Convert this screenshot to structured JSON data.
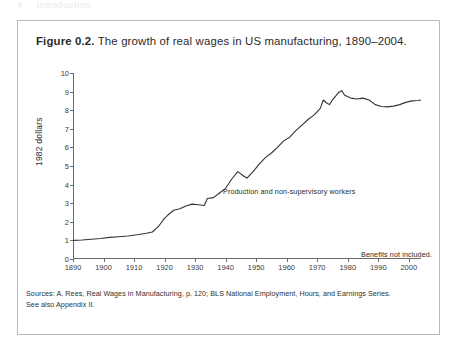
{
  "page": {
    "header_number": "4",
    "header_title": "Introduction"
  },
  "figure": {
    "label": "Figure 0.2.",
    "caption": "The growth of real wages in US manufacturing, 1890–2004.",
    "sources_line1": "Sources: A. Rees, Real Wages in Manufacturing, p. 120;  BLS National Employment, Hours, and Earnings Series.",
    "sources_line2": "See also Appendix II."
  },
  "chart_data": {
    "type": "line",
    "title": "The growth of real wages in US manufacturing, 1890–2004",
    "xlabel": "",
    "ylabel": "1982 dollars",
    "xlim": [
      1890,
      2004
    ],
    "ylim": [
      0,
      10
    ],
    "grid": false,
    "legend_position": "none",
    "x_ticks": [
      1890,
      1900,
      1910,
      1920,
      1930,
      1940,
      1950,
      1960,
      1970,
      1980,
      1990,
      2000
    ],
    "y_ticks": [
      0,
      1,
      2,
      3,
      4,
      5,
      6,
      7,
      8,
      9,
      10
    ],
    "annotations": [
      {
        "text": "Production and non-supervisory workers",
        "x": 1948,
        "y": 4.9
      },
      {
        "text": "Benefits not included.",
        "x": 1988,
        "y": 1.55
      }
    ],
    "series": [
      {
        "name": "Real wages, production and non-supervisory workers",
        "color": "#333333",
        "x": [
          1890,
          1893,
          1896,
          1899,
          1902,
          1905,
          1908,
          1911,
          1914,
          1916,
          1918,
          1920,
          1921,
          1923,
          1925,
          1927,
          1929,
          1931,
          1933,
          1934,
          1936,
          1938,
          1940,
          1942,
          1944,
          1946,
          1947,
          1949,
          1951,
          1953,
          1955,
          1957,
          1959,
          1961,
          1963,
          1965,
          1967,
          1969,
          1971,
          1972,
          1973,
          1974,
          1975,
          1977,
          1978,
          1979,
          1981,
          1983,
          1985,
          1987,
          1989,
          1991,
          1993,
          1995,
          1997,
          1999,
          2001,
          2003,
          2004
        ],
        "values": [
          1.0,
          1.02,
          1.06,
          1.1,
          1.16,
          1.2,
          1.24,
          1.3,
          1.38,
          1.45,
          1.75,
          2.2,
          2.35,
          2.62,
          2.7,
          2.85,
          2.95,
          2.92,
          2.88,
          3.25,
          3.3,
          3.55,
          3.8,
          4.3,
          4.7,
          4.45,
          4.35,
          4.7,
          5.1,
          5.45,
          5.7,
          6.0,
          6.35,
          6.55,
          6.9,
          7.2,
          7.5,
          7.75,
          8.1,
          8.55,
          8.4,
          8.3,
          8.55,
          8.95,
          9.05,
          8.8,
          8.65,
          8.6,
          8.65,
          8.55,
          8.3,
          8.2,
          8.18,
          8.22,
          8.3,
          8.42,
          8.5,
          8.52,
          8.55
        ]
      }
    ]
  }
}
